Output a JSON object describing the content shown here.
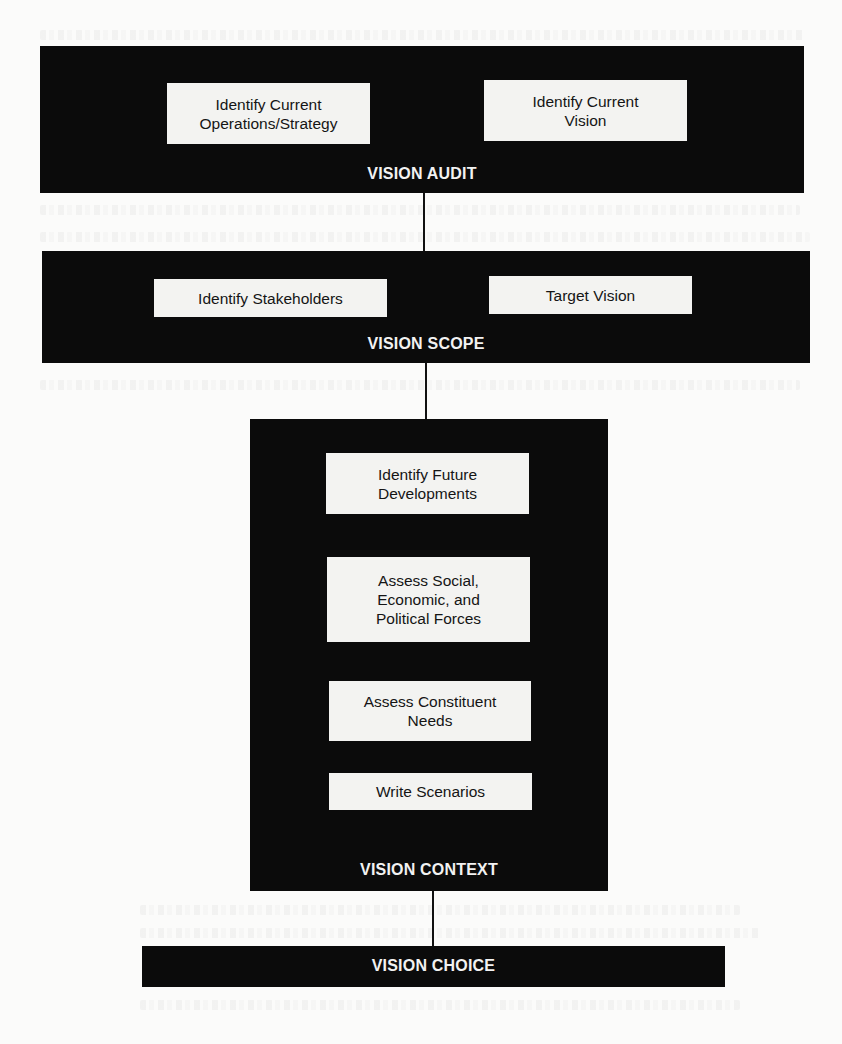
{
  "diagram": {
    "type": "process-flow",
    "direction": "top-to-bottom",
    "colors": {
      "stage_fill": "#0b0b0b",
      "step_fill": "#f3f3f1",
      "stage_label": "#f2f2f2",
      "step_text": "#151515",
      "connector": "#111111",
      "background": "#fbfbfa"
    },
    "stages": [
      {
        "id": "vision-audit",
        "label": "VISION AUDIT",
        "steps": [
          {
            "label": "Identify Current\nOperations/Strategy"
          },
          {
            "label": "Identify Current\nVision"
          }
        ]
      },
      {
        "id": "vision-scope",
        "label": "VISION SCOPE",
        "steps": [
          {
            "label": "Identify Stakeholders"
          },
          {
            "label": "Target Vision"
          }
        ]
      },
      {
        "id": "vision-context",
        "label": "VISION CONTEXT",
        "steps": [
          {
            "label": "Identify Future\nDevelopments"
          },
          {
            "label": "Assess Social,\nEconomic, and\nPolitical Forces"
          },
          {
            "label": "Assess Constituent\nNeeds"
          },
          {
            "label": "Write Scenarios"
          }
        ]
      },
      {
        "id": "vision-choice",
        "label": "VISION CHOICE",
        "steps": []
      }
    ],
    "connections": [
      {
        "from": "vision-audit",
        "to": "vision-scope"
      },
      {
        "from": "vision-scope",
        "to": "vision-context"
      },
      {
        "from": "vision-context",
        "to": "vision-choice"
      }
    ]
  }
}
